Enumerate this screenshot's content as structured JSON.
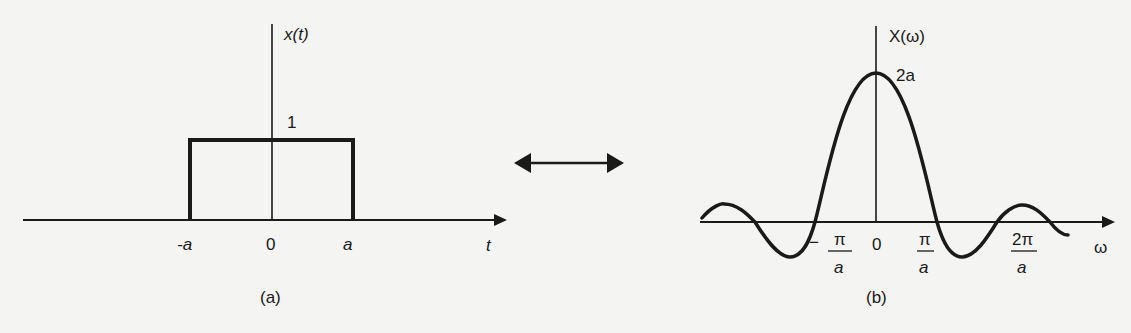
{
  "figure": {
    "panel_a": {
      "caption": "(a)",
      "y_axis_label": "x(t)",
      "x_axis_label": "t",
      "level_label": "1",
      "ticks": [
        "-a",
        "0",
        "a"
      ],
      "description": "Rectangular pulse of height 1 from t = -a to t = a"
    },
    "transform_arrow": {
      "description": "Double-headed arrow indicating Fourier transform pair"
    },
    "panel_b": {
      "caption": "(b)",
      "y_axis_label": "X(ω)",
      "x_axis_label": "ω",
      "peak_label": "2a",
      "ticks": [
        {
          "sign": "−",
          "num": "π",
          "den": "a"
        },
        {
          "sign": "",
          "num": "0",
          "den": ""
        },
        {
          "sign": "",
          "num": "π",
          "den": "a"
        },
        {
          "sign": "",
          "num": "2π",
          "den": "a"
        }
      ],
      "description": "Sinc-shaped spectrum X(ω) = 2 sin(aω)/ω with peak 2a at ω = 0"
    }
  },
  "colors": {
    "ink": "#1a1a1a",
    "paper": "#f4f4f2"
  }
}
